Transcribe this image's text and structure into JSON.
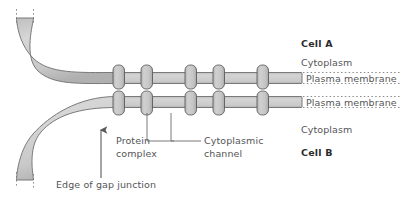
{
  "figure": {
    "title_alt": "Gap junction structure between two cells",
    "colors": {
      "membrane_fill": "#c9c9c9",
      "membrane_fill_light": "#d2d2d2",
      "membrane_stroke": "#6e6e6e",
      "protein_fill": "#c2c2c2",
      "protein_stroke": "#5d5d5d",
      "dotted_line": "#8d8d8d",
      "text": "#555558",
      "text_bold": "#2c2c2e",
      "background": "#ffffff"
    }
  },
  "right_labels": {
    "cell_a": "Cell A",
    "cytoplasm_top": "Cytoplasm",
    "plasma_membrane_top": "Plasma membrane",
    "plasma_membrane_bottom": "Plasma membrane",
    "cytoplasm_bottom": "Cytoplasm",
    "cell_b": "Cell B"
  },
  "callouts": {
    "protein_complex_line1": "Protein",
    "protein_complex_line2": "complex",
    "cytoplasmic_channel_line1": "Cytoplasmic",
    "cytoplasmic_channel_line2": "channel",
    "edge_of_gap_junction": "Edge of gap junction"
  },
  "diagram_data": {
    "type": "biological-schematic",
    "protein_complex_count": 4,
    "membrane_layers": 2,
    "membrane_band_thickness_px": 11,
    "upper_membrane_y_px": 72,
    "lower_membrane_y_px": 96,
    "protein_capsule_x_px": [
      118,
      146,
      190,
      218,
      262
    ],
    "arrow_direction": "up",
    "cut_edge_markers": "vertical-dotted"
  }
}
